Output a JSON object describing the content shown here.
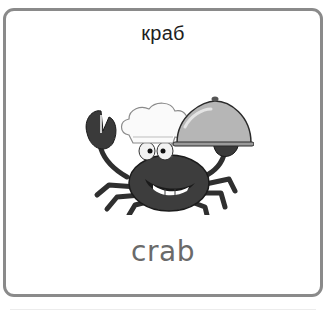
{
  "card": {
    "title": "краб",
    "word": "crab",
    "illustration": {
      "subject": "crab-chef-icon",
      "description": "Cartoon crab wearing a chef hat, smiling and holding a serving cloche"
    },
    "colors": {
      "border": "#8a8a8a",
      "title_text": "#1e1e1e",
      "word_text": "#6a6a6a",
      "crab_body": "#3a3a3a",
      "cloche": "#b4b4b4"
    }
  }
}
